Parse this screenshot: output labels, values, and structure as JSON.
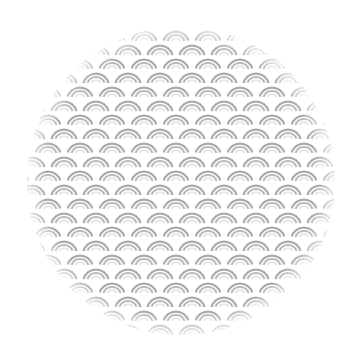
{
  "image": {
    "description": "Circular swatch with seigaiha wave pattern",
    "background": "#ffffff",
    "circle": {
      "cx": 181,
      "cy": 181,
      "r": 154
    },
    "pattern": {
      "name": "seigaiha",
      "tile_width": 32,
      "row_height": 14,
      "stroke_color": "#a9a9a9",
      "inner_stroke_color": "#d0d0d0",
      "fill": "#ffffff"
    }
  }
}
